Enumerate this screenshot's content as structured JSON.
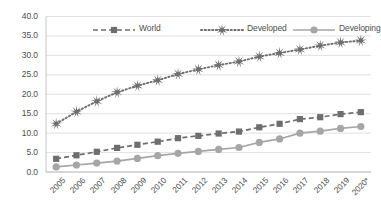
{
  "chart_data": {
    "type": "line",
    "title": "",
    "subtitle": "",
    "xlabel": "",
    "ylabel": "",
    "categories": [
      "2005",
      "2006",
      "2007",
      "2008",
      "2009",
      "2010",
      "2011",
      "2012",
      "2013",
      "2014",
      "2015",
      "2016",
      "2017",
      "2018",
      "2019",
      "2020*"
    ],
    "ylim": [
      0.0,
      40.0
    ],
    "ytick_labels": [
      "0.0",
      "5.0",
      "10.0",
      "15.0",
      "20.0",
      "25.0",
      "30.0",
      "35.0",
      "40.0"
    ],
    "ytick_values": [
      0.0,
      5.0,
      10.0,
      15.0,
      20.0,
      25.0,
      30.0,
      35.0,
      40.0
    ],
    "grid": true,
    "legend_position": "top-inside",
    "series": [
      {
        "name": "World",
        "marker": "square",
        "line_style": "dashed",
        "color": "#6e6e6e",
        "values": [
          3.4,
          4.3,
          5.2,
          6.2,
          7.0,
          7.8,
          8.7,
          9.3,
          9.9,
          10.4,
          11.5,
          12.4,
          13.6,
          14.1,
          14.9,
          15.4
        ]
      },
      {
        "name": "Developed",
        "marker": "star",
        "line_style": "dotted",
        "color": "#6e6e6e",
        "values": [
          12.4,
          15.5,
          18.2,
          20.5,
          22.2,
          23.6,
          25.2,
          26.4,
          27.5,
          28.4,
          29.7,
          30.6,
          31.5,
          32.5,
          33.3,
          33.8
        ]
      },
      {
        "name": "Developing",
        "marker": "circle",
        "line_style": "solid",
        "color": "#a6a6a6",
        "values": [
          1.3,
          1.8,
          2.3,
          2.8,
          3.5,
          4.2,
          4.8,
          5.3,
          5.8,
          6.3,
          7.6,
          8.5,
          10.0,
          10.5,
          11.2,
          11.7
        ]
      }
    ]
  },
  "axis": {
    "gridline_color": "#d9d9d9",
    "axis_line_color": "#bfbfbf",
    "tick_text_color": "#4d4d4d"
  },
  "legend": {
    "items": [
      {
        "label": "World",
        "marker": "square-marker-icon"
      },
      {
        "label": "Developed",
        "marker": "star-marker-icon"
      },
      {
        "label": "Developing",
        "marker": "circle-marker-icon"
      }
    ]
  }
}
